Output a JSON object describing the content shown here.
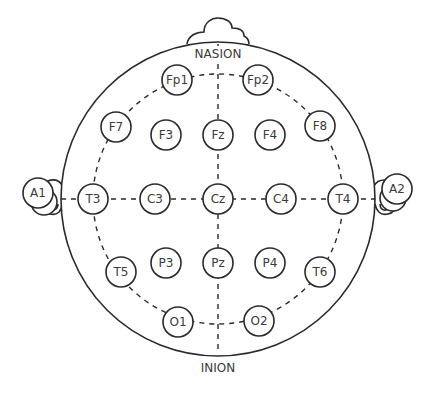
{
  "diagram": {
    "colors": {
      "stroke": "#2a2a2a",
      "text": "#3a3a3a",
      "background": "#ffffff"
    },
    "landmarks": {
      "nasion": "NASION",
      "inion": "INION"
    },
    "electrodes": [
      {
        "id": "Fp1",
        "label": "Fp1",
        "x": 177,
        "y": 80
      },
      {
        "id": "Fp2",
        "label": "Fp2",
        "x": 258,
        "y": 80
      },
      {
        "id": "F7",
        "label": "F7",
        "x": 116,
        "y": 127
      },
      {
        "id": "F3",
        "label": "F3",
        "x": 166,
        "y": 135
      },
      {
        "id": "Fz",
        "label": "Fz",
        "x": 218,
        "y": 135
      },
      {
        "id": "F4",
        "label": "F4",
        "x": 270,
        "y": 135
      },
      {
        "id": "F8",
        "label": "F8",
        "x": 320,
        "y": 126
      },
      {
        "id": "A1",
        "label": "A1",
        "x": 38,
        "y": 193
      },
      {
        "id": "T3",
        "label": "T3",
        "x": 93,
        "y": 199
      },
      {
        "id": "C3",
        "label": "C3",
        "x": 155,
        "y": 199
      },
      {
        "id": "Cz",
        "label": "Cz",
        "x": 218,
        "y": 199
      },
      {
        "id": "C4",
        "label": "C4",
        "x": 281,
        "y": 199
      },
      {
        "id": "T4",
        "label": "T4",
        "x": 343,
        "y": 199
      },
      {
        "id": "A2",
        "label": "A2",
        "x": 397,
        "y": 189
      },
      {
        "id": "T5",
        "label": "T5",
        "x": 121,
        "y": 272
      },
      {
        "id": "P3",
        "label": "P3",
        "x": 166,
        "y": 263
      },
      {
        "id": "Pz",
        "label": "Pz",
        "x": 218,
        "y": 263
      },
      {
        "id": "P4",
        "label": "P4",
        "x": 270,
        "y": 263
      },
      {
        "id": "T6",
        "label": "T6",
        "x": 320,
        "y": 272
      },
      {
        "id": "O1",
        "label": "O1",
        "x": 178,
        "y": 322
      },
      {
        "id": "O2",
        "label": "O2",
        "x": 259,
        "y": 321
      }
    ]
  }
}
